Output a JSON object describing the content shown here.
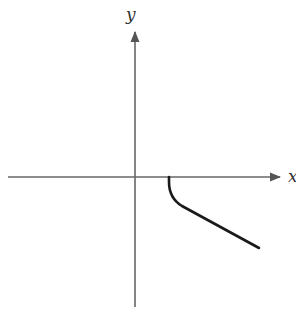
{
  "diagram": {
    "type": "function-sketch",
    "axes": {
      "x_label": "x",
      "y_label": "y",
      "axis_color": "#555555",
      "origin_px": [
        135,
        177
      ]
    },
    "curve": {
      "description": "Curve starting on positive x-axis with vertical tangent, bending down and continuing as a decreasing near-linear branch to the lower right",
      "color": "#1a1a1a",
      "start_px": [
        169,
        177
      ],
      "end_px": [
        259,
        248
      ]
    }
  }
}
